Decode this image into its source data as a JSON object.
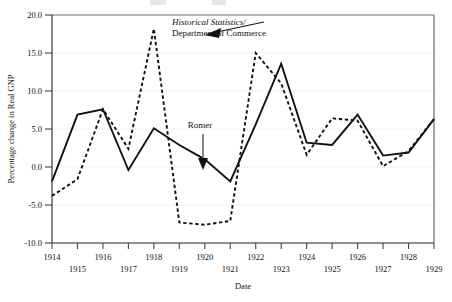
{
  "figure": {
    "background": "#ffffff",
    "frame_color": "#6b6b6b",
    "grid_color": "#cfcfcf",
    "series_colors": {
      "romer": "#111111",
      "historical": "#111111"
    }
  },
  "chart_data": {
    "type": "line",
    "title": "",
    "xlabel": "Date",
    "ylabel": "Percentage change in Real GNP",
    "x": [
      1914,
      1915,
      1916,
      1917,
      1918,
      1919,
      1920,
      1921,
      1922,
      1923,
      1924,
      1925,
      1926,
      1927,
      1928,
      1929
    ],
    "xtick_labels": [
      "1914",
      "1915",
      "1916",
      "1917",
      "1918",
      "1919",
      "1920",
      "1921",
      "1922",
      "1923",
      "1924",
      "1925",
      "1926",
      "1927",
      "1928",
      "1929"
    ],
    "ytick_labels": [
      "20.0",
      "15.0",
      "10.0",
      "5.0",
      "0.0",
      "-5.0",
      "-10.0"
    ],
    "ytick_values": [
      20.0,
      15.0,
      10.0,
      5.0,
      0.0,
      -5.0,
      -10.0
    ],
    "xlim": [
      1914,
      1929
    ],
    "ylim": [
      -10.0,
      20.0
    ],
    "grid": true,
    "grid_axis": "y",
    "legend": "annotations",
    "series": [
      {
        "name": "Romer",
        "style": "solid",
        "values": [
          -1.9,
          6.9,
          7.6,
          -0.4,
          5.1,
          2.9,
          1.0,
          -1.9,
          5.6,
          13.6,
          3.2,
          2.9,
          6.9,
          1.5,
          1.9,
          6.3
        ]
      },
      {
        "name": "Historical Statistics/Department of Commerce",
        "style": "dashed",
        "values": [
          -3.8,
          -1.6,
          7.6,
          2.4,
          18.2,
          -7.3,
          -7.6,
          -7.1,
          15.0,
          11.0,
          1.6,
          6.4,
          6.1,
          0.1,
          2.1,
          6.3
        ]
      }
    ],
    "annotations": [
      {
        "id": "historical-label",
        "line1_italic": "Historical Statistics/",
        "line2": "Department of Commerce",
        "points_to_year": 1918,
        "points_to_value": 17.2
      },
      {
        "id": "romer-label",
        "text": "Romer",
        "points_to_year": 1920,
        "points_to_value": 0.6
      }
    ]
  }
}
